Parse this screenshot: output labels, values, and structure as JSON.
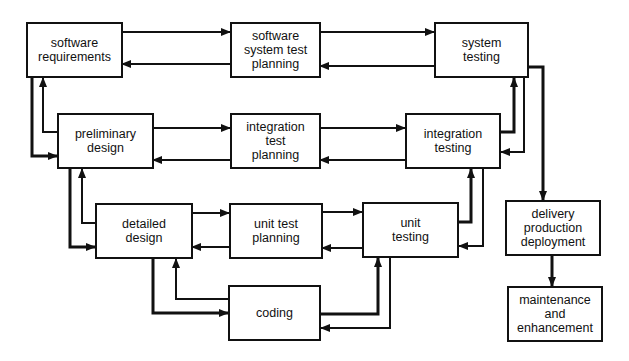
{
  "diagram": {
    "type": "V-model software development lifecycle",
    "boxes": {
      "software_requirements": "software\nrequirements",
      "software_system_test_planning": "software\nsystem test\nplanning",
      "system_testing": "system\ntesting",
      "preliminary_design": "preliminary\ndesign",
      "integration_test_planning": "integration\ntest\nplanning",
      "integration_testing": "integration\ntesting",
      "detailed_design": "detailed\ndesign",
      "unit_test_planning": "unit test\nplanning",
      "unit_testing": "unit\ntesting",
      "coding": "coding",
      "delivery": "delivery\nproduction\ndeployment",
      "maintenance": "maintenance\nand\nenhancement"
    },
    "colors": {
      "line": "#111111",
      "background": "#ffffff"
    }
  }
}
